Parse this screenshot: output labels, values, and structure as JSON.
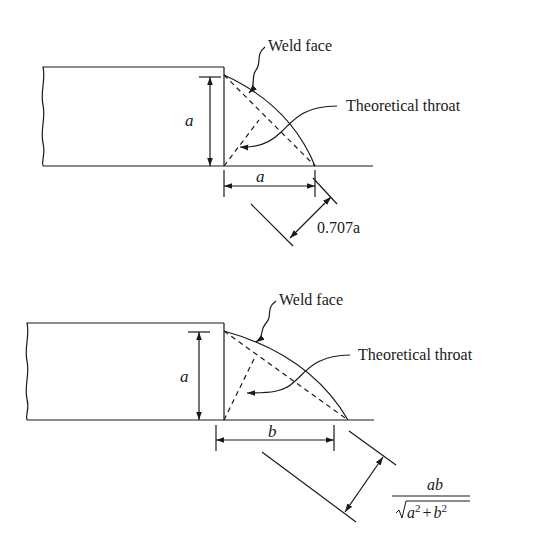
{
  "figure_top": {
    "weld_face_label": "Weld face",
    "throat_label": "Theoretical throat",
    "leg_vertical": "a",
    "leg_horizontal": "a",
    "throat_dimension": "0.707a"
  },
  "figure_bottom": {
    "weld_face_label": "Weld face",
    "throat_label": "Theoretical throat",
    "leg_vertical": "a",
    "leg_horizontal": "b",
    "throat_numerator": "ab",
    "throat_denominator_a": "a",
    "throat_denominator_b": "b",
    "throat_sup": "2",
    "throat_plus": "+"
  },
  "colors": {
    "ink": "#1a1a1a",
    "background": "#ffffff"
  }
}
